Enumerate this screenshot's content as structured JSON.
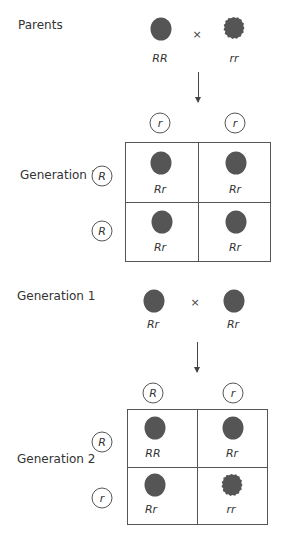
{
  "colors": {
    "pea": "#555555",
    "line": "#555555",
    "text": "#333333"
  },
  "parents": {
    "label": "Parents",
    "cross_symbol": "×",
    "left": {
      "genotype": "RR",
      "shape": "round"
    },
    "right": {
      "genotype": "rr",
      "shape": "wrinkled"
    }
  },
  "generation1_square": {
    "label": "Generation 1",
    "col_alleles": [
      "r",
      "r"
    ],
    "row_alleles": [
      "R",
      "R"
    ],
    "cells": [
      [
        {
          "genotype": "Rr",
          "shape": "round"
        },
        {
          "genotype": "Rr",
          "shape": "round"
        }
      ],
      [
        {
          "genotype": "Rr",
          "shape": "round"
        },
        {
          "genotype": "Rr",
          "shape": "round"
        }
      ]
    ]
  },
  "generation1_cross": {
    "label": "Generation 1",
    "cross_symbol": "×",
    "left": {
      "genotype": "Rr",
      "shape": "round"
    },
    "right": {
      "genotype": "Rr",
      "shape": "round"
    }
  },
  "generation2_square": {
    "label": "Generation 2",
    "col_alleles": [
      "R",
      "r"
    ],
    "row_alleles": [
      "R",
      "r"
    ],
    "cells": [
      [
        {
          "genotype": "RR",
          "shape": "round"
        },
        {
          "genotype": "Rr",
          "shape": "round"
        }
      ],
      [
        {
          "genotype": "Rr",
          "shape": "round"
        },
        {
          "genotype": "rr",
          "shape": "wrinkled"
        }
      ]
    ]
  }
}
